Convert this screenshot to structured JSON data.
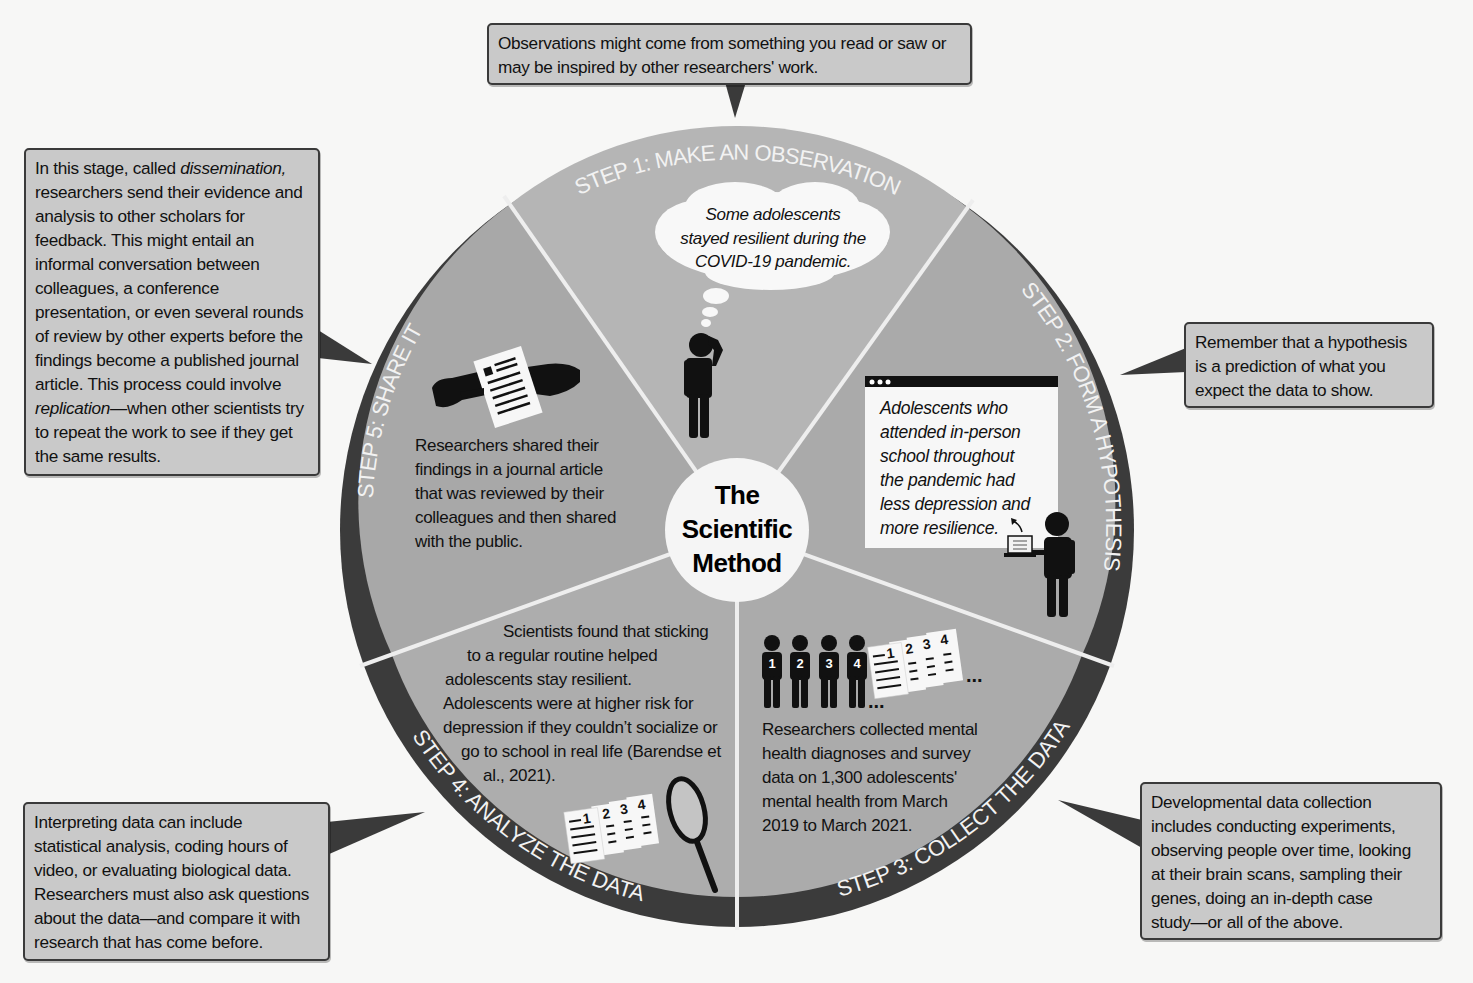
{
  "diagram": {
    "title": "The Scientific Method",
    "title_lines": [
      "The",
      "Scientific",
      "Method"
    ],
    "colors": {
      "background": "#f7f7f6",
      "ring": "#3b3b3b",
      "wedge_light": "#b3b3b3",
      "wedge_mid": "#a6a6a6",
      "divider": "#f2f2f2",
      "callout_fill": "#c9c9c9",
      "callout_border": "#3a3a3a",
      "icon": "#111111"
    },
    "steps": [
      {
        "number": 1,
        "label": "STEP 1: MAKE AN OBSERVATION",
        "example": "Some adolescents stayed resilient during the COVID-19 pandemic.",
        "example_lines": [
          "Some adolescents",
          "stayed resilient during the",
          "COVID-19 pandemic."
        ],
        "icon": "thinking-person-icon",
        "callout_lines": [
          "Observations might come from something you read or saw or",
          "may be inspired by other researchers' work."
        ]
      },
      {
        "number": 2,
        "label": "STEP 2: FORM A HYPOTHESIS",
        "example": "Adolescents who attended in-person school throughout the pandemic had less depression and more resilience.",
        "example_lines": [
          "Adolescents who",
          "attended in-person",
          "school throughout",
          "the pandemic had",
          "less depression and",
          "more resilience."
        ],
        "icon": "presenter-with-laptop-icon",
        "callout_lines": [
          "Remember that a hypothesis",
          "is a prediction of what you",
          "expect the data to show."
        ]
      },
      {
        "number": 3,
        "label": "STEP 3: COLLECT THE DATA",
        "example": "Researchers collected mental health diagnoses and survey data on 1,300 adolescents' mental health from March 2019 to March 2021.",
        "example_lines": [
          "Researchers collected mental",
          "health diagnoses and survey",
          "data on 1,300 adolescents'",
          "mental health from March",
          "2019 to March 2021."
        ],
        "icon": "numbered-people-and-surveys-icon",
        "icon_numbers": [
          "1",
          "2",
          "3",
          "4"
        ],
        "ellipsis": "...",
        "callout_lines": [
          "Developmental data collection",
          "includes conducting experiments,",
          "observing people over time, looking",
          "at their brain scans, sampling their",
          "genes, doing an in-depth case",
          "study—or all of the above."
        ]
      },
      {
        "number": 4,
        "label": "STEP 4: ANALYZE THE DATA",
        "example": "Scientists found that sticking to a regular routine helped adolescents stay resilient. Adolescents were at higher risk for depression if they couldn't socialize or go to school in real life (Barendse et al., 2021).",
        "example_lines": [
          "Scientists found that sticking",
          "to a regular routine helped",
          "adolescents stay resilient.",
          "Adolescents were at higher risk for",
          "depression if they couldn’t socialize or",
          "go to school in real life (Barendse et",
          "al., 2021)."
        ],
        "icon": "documents-and-magnifier-icon",
        "icon_numbers": [
          "1",
          "2",
          "3",
          "4"
        ],
        "callout_lines": [
          "Interpreting data can include",
          "statistical analysis, coding hours of",
          "video, or evaluating biological data.",
          "Researchers must also ask questions",
          "about the data—and compare it with",
          "research that has come before."
        ]
      },
      {
        "number": 5,
        "label": "STEP 5: SHARE IT",
        "example": "Researchers shared their findings in a journal article that was reviewed by their colleagues and then shared with the public.",
        "example_lines": [
          "Researchers shared their",
          "findings in a journal article",
          "that was reviewed by their",
          "colleagues and then shared",
          "with the public."
        ],
        "icon": "hands-exchanging-document-icon",
        "callout_segments": [
          {
            "text": "In this stage, called ",
            "italic": false
          },
          {
            "text": "dissemination,",
            "italic": true
          },
          {
            "text": " researchers send their evidence and analysis to other scholars for feedback. This might entail an informal conversation between colleagues, a conference presentation, or even several rounds of review by other experts before the findings become a published journal article. This process could involve ",
            "italic": false
          },
          {
            "text": "replication",
            "italic": true
          },
          {
            "text": "—when other scientists try to repeat the work to see if they get the same results.",
            "italic": false
          }
        ]
      }
    ]
  }
}
